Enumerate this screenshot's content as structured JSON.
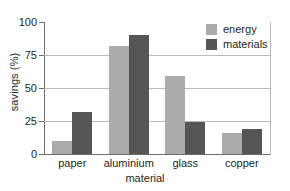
{
  "chart_data": {
    "type": "bar",
    "title": "",
    "xlabel": "material",
    "ylabel": "savings (%)",
    "categories": [
      "paper",
      "aluminium",
      "glass",
      "copper"
    ],
    "series": [
      {
        "name": "energy",
        "color": "#ababab",
        "values": [
          10,
          82,
          59,
          16
        ]
      },
      {
        "name": "materials",
        "color": "#555555",
        "values": [
          32,
          90,
          24,
          19
        ]
      }
    ],
    "ylim": [
      0,
      100
    ],
    "yticks": [
      0,
      25,
      50,
      75,
      100
    ],
    "ytick_labels": [
      "0",
      "25",
      "50",
      "75",
      "100"
    ],
    "gridlines": [
      25,
      50,
      75
    ],
    "grid": true,
    "legend_position": "top-right",
    "legend_entries": [
      "energy",
      "materials"
    ]
  }
}
